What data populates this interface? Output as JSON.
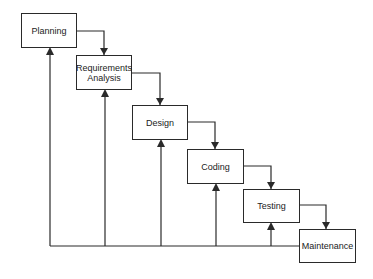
{
  "diagram": {
    "type": "waterfall-process",
    "stages": [
      {
        "id": "planning",
        "label": "Planning"
      },
      {
        "id": "requirements",
        "label": "Requirements\nAnalysis"
      },
      {
        "id": "design",
        "label": "Design"
      },
      {
        "id": "coding",
        "label": "Coding"
      },
      {
        "id": "testing",
        "label": "Testing"
      },
      {
        "id": "maintenance",
        "label": "Maintenance"
      }
    ],
    "forward_flow": [
      [
        "planning",
        "requirements"
      ],
      [
        "requirements",
        "design"
      ],
      [
        "design",
        "coding"
      ],
      [
        "coding",
        "testing"
      ],
      [
        "testing",
        "maintenance"
      ]
    ],
    "feedback_from": "maintenance",
    "feedback_to": [
      "planning",
      "requirements",
      "design",
      "coding",
      "testing"
    ],
    "colors": {
      "line": "#2a2a2a",
      "box_border": "#2a2a2a",
      "background": "#ffffff",
      "text": "#222222"
    }
  }
}
